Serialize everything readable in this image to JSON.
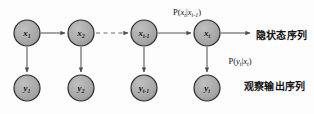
{
  "figure": {
    "background_color": "#fdfdfd",
    "node_fill": "#a8a8a8",
    "node_stroke": "#2b2b2b",
    "arrow_color": "#4d4d4d",
    "text_color": "#141414"
  },
  "hidden_nodes": [
    {
      "id": "x1",
      "base": "x",
      "sub": "1",
      "cx": 27,
      "cy": 33,
      "r": 13
    },
    {
      "id": "x2",
      "base": "x",
      "sub": "2",
      "cx": 81,
      "cy": 33,
      "r": 13
    },
    {
      "id": "xt_1",
      "base": "x",
      "sub": "t-1",
      "cx": 144,
      "cy": 33,
      "r": 13
    },
    {
      "id": "xt",
      "base": "x",
      "sub": "t",
      "cx": 207,
      "cy": 33,
      "r": 13
    }
  ],
  "observed_nodes": [
    {
      "id": "y1",
      "base": "y",
      "sub": "1",
      "cx": 27,
      "cy": 88,
      "r": 13
    },
    {
      "id": "y2",
      "base": "y",
      "sub": "2",
      "cx": 81,
      "cy": 88,
      "r": 13
    },
    {
      "id": "yt_1",
      "base": "y",
      "sub": "t-1",
      "cx": 144,
      "cy": 88,
      "r": 13
    },
    {
      "id": "yt",
      "base": "y",
      "sub": "t",
      "cx": 207,
      "cy": 88,
      "r": 13
    }
  ],
  "labels": {
    "transition_prob": {
      "prefix": "P(",
      "x_t": "x",
      "x_t_sub": "t",
      "bar": "|",
      "x_prev": "x",
      "x_prev_sub": "t-1",
      "suffix": ")",
      "text": "P(x t | x t-1 )",
      "cx": 187,
      "cy": 12
    },
    "emission_prob": {
      "prefix": "P(",
      "y_t": "y",
      "y_t_sub": "t",
      "bar": "|",
      "x_t": "x",
      "x_t_sub": "t",
      "suffix": ")",
      "text": "P( y t | x t )",
      "cx": 240,
      "cy": 61
    },
    "hidden_sequence": {
      "text": "隐状态序列",
      "x": 256,
      "y": 34
    },
    "observed_sequence": {
      "text": "观察输出序列",
      "x": 244,
      "y": 85
    }
  },
  "edges": {
    "solid_transitions": [
      {
        "from": "x1",
        "to": "x2",
        "x1": 41,
        "x2": 67,
        "y": 33
      },
      {
        "from": "xt_1",
        "to": "xt",
        "x1": 158,
        "x2": 193,
        "y": 33
      }
    ],
    "dashed_transition": {
      "from": "x2",
      "to": "xt_1",
      "x1": 95,
      "x2": 130,
      "y": 33,
      "style": "dashed"
    },
    "output_arrow": {
      "from": "xt",
      "to": "hidden_sequence_label",
      "x1": 221,
      "x2": 252,
      "y": 33
    },
    "emissions": [
      {
        "from": "x1",
        "to": "y1",
        "x": 27,
        "y1": 47,
        "y2": 74
      },
      {
        "from": "x2",
        "to": "y2",
        "x": 81,
        "y1": 47,
        "y2": 74
      },
      {
        "from": "xt_1",
        "to": "yt_1",
        "x": 144,
        "y1": 47,
        "y2": 74
      },
      {
        "from": "xt",
        "to": "yt",
        "x": 207,
        "y1": 47,
        "y2": 74
      }
    ]
  }
}
